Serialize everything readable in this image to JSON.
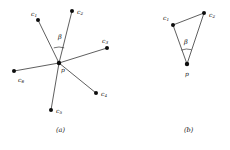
{
  "figure": {
    "background_color": "#ffffff",
    "stroke_color": "#1a1a1a",
    "vertex_color": "#0d0d0d",
    "width": 230,
    "height": 150
  },
  "panels": [
    {
      "id": "a",
      "caption": "(a)",
      "caption_pos": {
        "x": 56,
        "y": 127
      },
      "center": {
        "label": "p",
        "x": 59,
        "y": 63,
        "label_x": 61,
        "label_y": 67
      },
      "angle_label": {
        "text": "β",
        "x": 58,
        "y": 34
      },
      "angle_arc": {
        "cx": 59,
        "cy": 63,
        "r": 16,
        "start_deg": 251,
        "end_deg": 289
      },
      "neighbors": [
        {
          "label": "c",
          "sub": "1",
          "x": 38,
          "y": 20,
          "label_x": 31,
          "label_y": 11
        },
        {
          "label": "c",
          "sub": "2",
          "x": 72,
          "y": 11,
          "label_x": 77,
          "label_y": 9
        },
        {
          "label": "c",
          "sub": "3",
          "x": 107,
          "y": 48,
          "label_x": 102,
          "label_y": 38
        },
        {
          "label": "c",
          "sub": "4",
          "x": 96,
          "y": 93,
          "label_x": 101,
          "label_y": 91
        },
        {
          "label": "c",
          "sub": "5",
          "x": 51,
          "y": 110,
          "label_x": 56,
          "label_y": 108
        },
        {
          "label": "c",
          "sub": "6",
          "x": 14,
          "y": 71,
          "label_x": 18,
          "label_y": 77
        }
      ],
      "edges": [
        {
          "from": "p",
          "to": "c1"
        },
        {
          "from": "p",
          "to": "c2"
        },
        {
          "from": "p",
          "to": "c3"
        },
        {
          "from": "p",
          "to": "c4"
        },
        {
          "from": "p",
          "to": "c5"
        },
        {
          "from": "p",
          "to": "c6"
        }
      ]
    },
    {
      "id": "b",
      "caption": "(b)",
      "caption_pos": {
        "x": 184,
        "y": 127
      },
      "center": {
        "label": "p",
        "x": 187,
        "y": 64,
        "label_x": 185,
        "label_y": 71
      },
      "angle_label": {
        "text": "β",
        "x": 184,
        "y": 39
      },
      "angle_arc": {
        "cx": 187,
        "cy": 64,
        "r": 15,
        "start_deg": 248,
        "end_deg": 287
      },
      "neighbors": [
        {
          "label": "c",
          "sub": "1",
          "x": 173,
          "y": 25,
          "label_x": 163,
          "label_y": 15
        },
        {
          "label": "c",
          "sub": "2",
          "x": 204,
          "y": 13,
          "label_x": 209,
          "label_y": 12
        }
      ],
      "edges": [
        {
          "from": "p",
          "to": "c1"
        },
        {
          "from": "p",
          "to": "c2"
        },
        {
          "from": "c1",
          "to": "c2"
        }
      ]
    }
  ]
}
